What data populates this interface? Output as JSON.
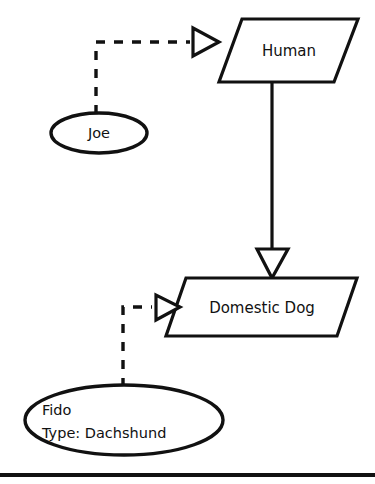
{
  "diagram": {
    "type": "uml-object-instantiation-diagram",
    "background_color": "#ffffff",
    "line_color": "#111111",
    "fill_color": "#ffffff",
    "classes": [
      {
        "id": "human",
        "name": "Human",
        "shape": "parallelogram"
      },
      {
        "id": "domestic-dog",
        "name": "Domestic Dog",
        "shape": "parallelogram"
      }
    ],
    "instances": [
      {
        "id": "joe",
        "shape": "ellipse",
        "lines": [
          "Joe"
        ]
      },
      {
        "id": "fido",
        "shape": "ellipse",
        "lines": [
          "Fido",
          "Type: Dachshund"
        ]
      }
    ],
    "edges": [
      {
        "id": "joe-to-human",
        "from": "joe",
        "to": "human",
        "style": "dashed",
        "arrowhead": "hollow-triangle",
        "relationship": "instantiation"
      },
      {
        "id": "fido-to-domestic-dog",
        "from": "fido",
        "to": "domestic-dog",
        "style": "dashed",
        "arrowhead": "hollow-triangle",
        "relationship": "instantiation"
      },
      {
        "id": "domestic-dog-to-human",
        "from": "human",
        "to": "domestic-dog",
        "style": "solid",
        "arrowhead": "hollow-triangle-down",
        "relationship": "generalization"
      }
    ],
    "footer_rule": {
      "visible": true
    }
  }
}
